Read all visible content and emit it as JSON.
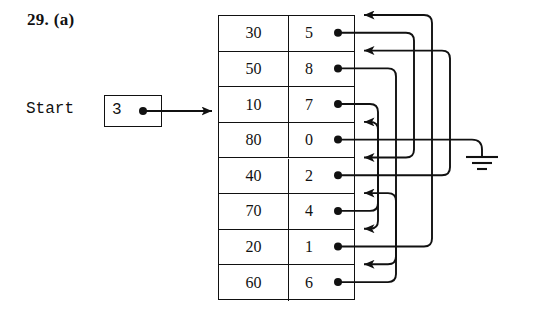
{
  "figure": {
    "label": "29. (a)",
    "caption_number": "29.",
    "caption_part": "(a)"
  },
  "start_pointer": {
    "label": "Start",
    "value": "3",
    "points_to_row_index": 3
  },
  "table": {
    "columns": [
      "data",
      "link"
    ],
    "rows": [
      {
        "index": 1,
        "data": "30",
        "link": "5"
      },
      {
        "index": 2,
        "data": "50",
        "link": "8"
      },
      {
        "index": 3,
        "data": "10",
        "link": "7"
      },
      {
        "index": 4,
        "data": "80",
        "link": "0"
      },
      {
        "index": 5,
        "data": "40",
        "link": "2"
      },
      {
        "index": 6,
        "data": "70",
        "link": "4"
      },
      {
        "index": 7,
        "data": "20",
        "link": "1"
      },
      {
        "index": 8,
        "data": "60",
        "link": "6"
      }
    ]
  },
  "ground": {
    "symbol_name": "ground-symbol",
    "meaning": "null",
    "from_row_index": 4
  },
  "colors": {
    "ink": "#111111",
    "background": "#ffffff"
  },
  "links": [
    {
      "from_row": 1,
      "to_row": 5,
      "link_value": "5"
    },
    {
      "from_row": 2,
      "to_row": 8,
      "link_value": "8"
    },
    {
      "from_row": 3,
      "to_row": 7,
      "link_value": "7"
    },
    {
      "from_row": 4,
      "to_row": 0,
      "link_value": "0"
    },
    {
      "from_row": 5,
      "to_row": 2,
      "link_value": "2"
    },
    {
      "from_row": 6,
      "to_row": 4,
      "link_value": "4"
    },
    {
      "from_row": 7,
      "to_row": 1,
      "link_value": "1"
    },
    {
      "from_row": 8,
      "to_row": 6,
      "link_value": "6"
    }
  ]
}
